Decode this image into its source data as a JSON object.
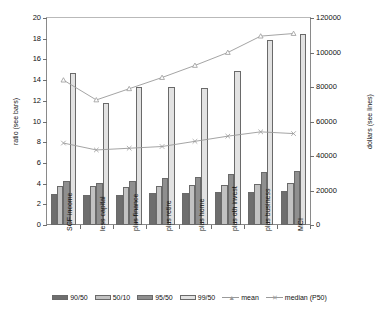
{
  "chart_data": {
    "type": "bar",
    "title": "",
    "xlabel": "",
    "ylabel": "ratio (see bars)",
    "ylabel_secondary": "dollars (see lines)",
    "grid": false,
    "legend_position": "bottom",
    "categories": [
      "SCF income",
      "less capital",
      "plus finance",
      "plus retire",
      "plus home",
      "plus oth invest",
      "plus business",
      "MCI"
    ],
    "ylim": [
      0,
      20
    ],
    "yticks": [
      0,
      2,
      4,
      6,
      8,
      10,
      12,
      14,
      16,
      18,
      20
    ],
    "ylim_secondary": [
      0,
      120000
    ],
    "yticks_secondary": [
      0,
      20000,
      40000,
      60000,
      80000,
      100000,
      120000
    ],
    "series": [
      {
        "name": "90/50",
        "axis": "left",
        "kind": "bar",
        "color": "#6e6e6e",
        "values": [
          3.0,
          2.9,
          2.9,
          3.1,
          3.1,
          3.2,
          3.2,
          3.3
        ]
      },
      {
        "name": "50/10",
        "axis": "left",
        "kind": "bar",
        "color": "#c2c2c2",
        "values": [
          3.8,
          3.8,
          3.7,
          3.8,
          3.9,
          3.9,
          4.0,
          4.1
        ]
      },
      {
        "name": "95/50",
        "axis": "left",
        "kind": "bar",
        "color": "#8f8f8f",
        "values": [
          4.3,
          4.1,
          4.3,
          4.5,
          4.6,
          4.9,
          5.1,
          5.2
        ]
      },
      {
        "name": "99/50",
        "axis": "left",
        "kind": "bar",
        "color": "#e2e2e2",
        "values": [
          14.7,
          11.8,
          13.3,
          13.3,
          13.2,
          14.9,
          17.9,
          18.5
        ]
      },
      {
        "name": "mean",
        "axis": "right",
        "kind": "line",
        "color": "#9a9a9a",
        "marker": "triangle",
        "values": [
          84000,
          72500,
          79000,
          85500,
          92500,
          100000,
          109500,
          111000
        ]
      },
      {
        "name": "median (P50)",
        "axis": "right",
        "kind": "line",
        "color": "#9a9a9a",
        "marker": "cross",
        "values": [
          47500,
          43500,
          44500,
          45500,
          48500,
          51500,
          54000,
          53000
        ]
      }
    ]
  },
  "axes": {
    "left_title": "ratio (see bars)",
    "right_title": "dollars (see lines)",
    "left_ticklabels": [
      "20",
      "18",
      "16",
      "14",
      "12",
      "10",
      "8",
      "6",
      "4",
      "2",
      "0"
    ],
    "right_ticklabels": [
      "120000",
      "100000",
      "80000",
      "60000",
      "40000",
      "20000",
      "0"
    ]
  },
  "legend": {
    "items": [
      {
        "label": "90/50",
        "type": "swatch",
        "color": "#6e6e6e"
      },
      {
        "label": "50/10",
        "type": "swatch",
        "color": "#c2c2c2"
      },
      {
        "label": "95/50",
        "type": "swatch",
        "color": "#8f8f8f"
      },
      {
        "label": "99/50",
        "type": "swatch",
        "color": "#e2e2e2"
      },
      {
        "label": "mean",
        "type": "line",
        "color": "#9a9a9a",
        "marker": "▲"
      },
      {
        "label": "median (P50)",
        "type": "line",
        "color": "#9a9a9a",
        "marker": "✕"
      }
    ]
  }
}
